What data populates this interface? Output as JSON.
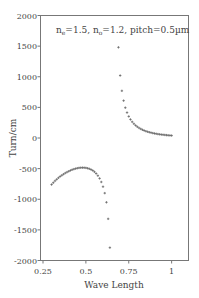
{
  "chart_data": {
    "type": "scatter",
    "title": "",
    "annotation": "n_e=1.5, n_o=1.2, pitch=0.5µm",
    "annotation_parts": {
      "ne": "n",
      "ne_sub": "e",
      "ne_val": "=1.5, ",
      "no": "n",
      "no_sub": "o",
      "no_val": "=1.2, pitch=0.5µm"
    },
    "xlabel": "Wave Length",
    "ylabel": "Turn/cm",
    "xlim": [
      0.25,
      1.1
    ],
    "ylim": [
      -2000,
      2000
    ],
    "xticks": [
      0.25,
      0.5,
      0.75,
      1
    ],
    "xtick_labels": [
      "0.25",
      "0.5",
      "0.75",
      "1"
    ],
    "yticks": [
      2000,
      1500,
      1000,
      500,
      0,
      -500,
      -1000,
      -1500,
      -2000
    ],
    "ytick_labels": [
      "2000",
      "1500",
      "1000",
      "500",
      "0",
      "-500",
      "-1000",
      "-1500",
      "-2000"
    ],
    "grid": false,
    "marker": "+",
    "series": [
      {
        "name": "branch-short",
        "x": [
          0.3,
          0.31,
          0.32,
          0.33,
          0.34,
          0.35,
          0.36,
          0.37,
          0.38,
          0.39,
          0.4,
          0.41,
          0.42,
          0.43,
          0.44,
          0.45,
          0.46,
          0.47,
          0.48,
          0.49,
          0.5,
          0.51,
          0.52,
          0.53,
          0.54,
          0.55,
          0.56,
          0.57,
          0.58,
          0.59,
          0.6,
          0.61,
          0.62,
          0.63,
          0.64
        ],
        "y": [
          -760,
          -730,
          -700,
          -675,
          -650,
          -628,
          -608,
          -590,
          -572,
          -557,
          -543,
          -530,
          -518,
          -508,
          -500,
          -493,
          -488,
          -485,
          -484,
          -485,
          -488,
          -494,
          -503,
          -515,
          -531,
          -552,
          -580,
          -615,
          -660,
          -718,
          -795,
          -900,
          -1050,
          -1320,
          -1790
        ]
      },
      {
        "name": "branch-long",
        "x": [
          0.69,
          0.7,
          0.71,
          0.72,
          0.73,
          0.74,
          0.75,
          0.76,
          0.77,
          0.78,
          0.79,
          0.8,
          0.81,
          0.82,
          0.83,
          0.84,
          0.85,
          0.86,
          0.87,
          0.88,
          0.89,
          0.9,
          0.91,
          0.92,
          0.93,
          0.94,
          0.95,
          0.96,
          0.97,
          0.98,
          0.99,
          1.0
        ],
        "y": [
          1480,
          1020,
          770,
          610,
          495,
          415,
          352,
          303,
          264,
          232,
          205,
          183,
          164,
          148,
          134,
          122,
          111,
          102,
          94,
          87,
          80,
          74,
          69,
          64,
          60,
          56,
          53,
          50,
          47,
          44,
          42,
          40
        ]
      }
    ]
  }
}
